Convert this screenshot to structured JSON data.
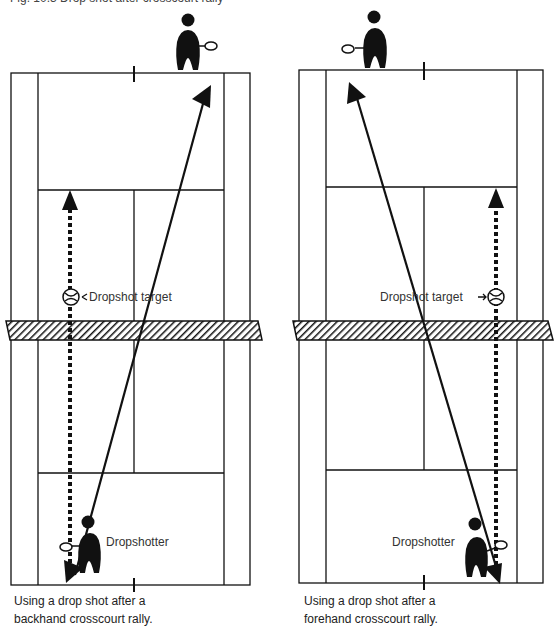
{
  "figure": {
    "top_caption_partial": "Fig. 10.3  Drop shot after crosscourt rally",
    "colors": {
      "ink": "#111111",
      "paper": "#ffffff"
    }
  },
  "left_diagram": {
    "target_label": "Dropshot target",
    "player_label": "Dropshotter",
    "caption_line1": "Using a drop shot after a",
    "caption_line2": "backhand crosscourt rally."
  },
  "right_diagram": {
    "target_label": "Dropshot target",
    "player_label": "Dropshotter",
    "caption_line1": "Using a drop shot after a",
    "caption_line2": "forehand crosscourt rally."
  }
}
